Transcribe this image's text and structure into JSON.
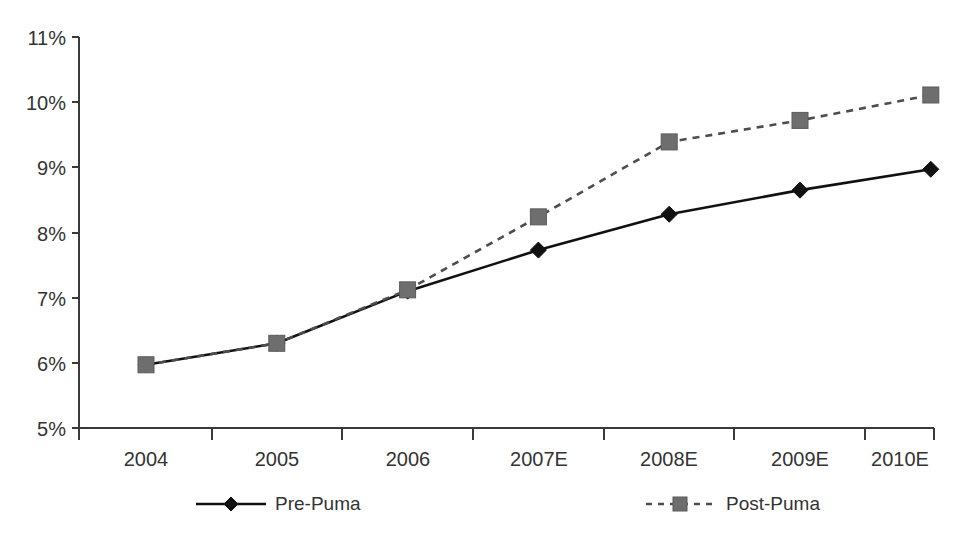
{
  "chart_data": {
    "type": "line",
    "title": "",
    "subtitle": "",
    "xlabel": "",
    "ylabel": "",
    "categories": [
      "2004",
      "2005",
      "2006",
      "2007E",
      "2008E",
      "2009E",
      "2010E"
    ],
    "series": [
      {
        "name": "Pre-Puma",
        "marker": "diamond",
        "line_style": "solid",
        "color": "#111111",
        "values": [
          5.97,
          6.3,
          7.1,
          7.73,
          8.28,
          8.65,
          8.97
        ]
      },
      {
        "name": "Post-Puma",
        "marker": "square",
        "line_style": "dashed",
        "color": "#6e6e6e",
        "values": [
          5.97,
          6.3,
          7.12,
          8.24,
          9.39,
          9.72,
          10.11
        ]
      }
    ],
    "ylim": [
      5,
      11
    ],
    "ytick_values": [
      5,
      6,
      7,
      8,
      9,
      10,
      11
    ],
    "ytick_labels": [
      "5%",
      "6%",
      "7%",
      "8%",
      "9%",
      "10%",
      "11%"
    ],
    "xtick_labels": [
      "2004",
      "2005",
      "2006",
      "2007E",
      "2008E",
      "2009E",
      "2010E"
    ],
    "grid": false,
    "legend_position": "bottom",
    "legend": [
      {
        "label": "Pre-Puma",
        "marker": "diamond",
        "line_style": "solid",
        "color": "#111111"
      },
      {
        "label": "Post-Puma",
        "marker": "square",
        "line_style": "dashed",
        "color": "#6e6e6e"
      }
    ],
    "value_unit": "percent"
  },
  "axes": {
    "y_axis_name": "percentage-axis",
    "x_axis_name": "year-axis"
  }
}
